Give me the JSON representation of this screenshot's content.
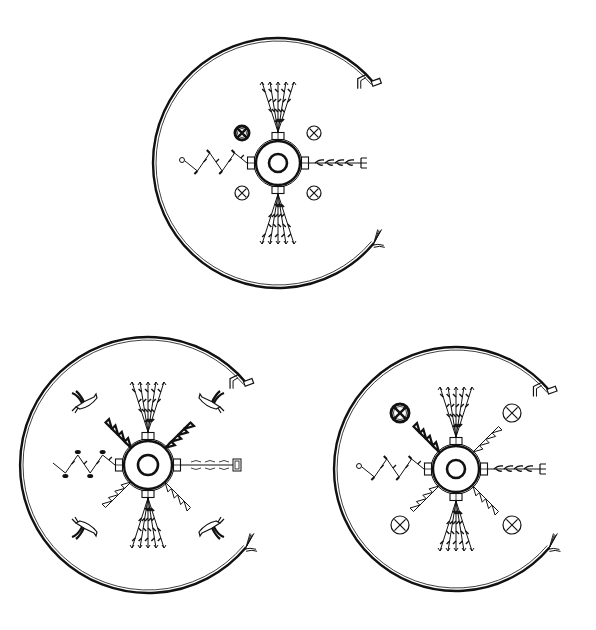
{
  "figure": {
    "background": "#ffffff",
    "ink": "#111111"
  },
  "diagrams": [
    {
      "id": "top",
      "cx": 278,
      "cy": 163,
      "ring_r": 22,
      "pool_r": 9,
      "arc_r": 125,
      "arc_open_deg": [
        -40,
        40
      ],
      "up_arm": "plant-fan",
      "down_arm": "plant-fan",
      "left_arm": "zigzag-lightning",
      "right_arm": "feathered-arrow",
      "corners": [
        "cross-circle-dark",
        "cross-circle",
        "cross-circle",
        "cross-circle"
      ],
      "diagonal_arms": "none"
    },
    {
      "id": "bottom-left",
      "cx": 148,
      "cy": 465,
      "ring_r": 24,
      "pool_r": 10,
      "arc_r": 128,
      "arc_open_deg": [
        -40,
        40
      ],
      "up_arm": "plant-fan",
      "down_arm": "plant-fan",
      "left_arm": "zigzag-flower",
      "right_arm": "loop-line-bar",
      "corners": [
        "bird",
        "bird",
        "bird",
        "bird"
      ],
      "diagonal_arms": "triangle-chains"
    },
    {
      "id": "bottom-right",
      "cx": 456,
      "cy": 469,
      "ring_r": 23,
      "pool_r": 9,
      "arc_r": 122,
      "arc_open_deg": [
        -40,
        40
      ],
      "up_arm": "plant-fan",
      "down_arm": "plant-fan",
      "left_arm": "zigzag-lightning",
      "right_arm": "feathered-arrow",
      "corners": [
        "cross-circle-dark",
        "cross-circle",
        "cross-circle",
        "cross-circle"
      ],
      "diagonal_arms": "triangle-chains"
    }
  ]
}
